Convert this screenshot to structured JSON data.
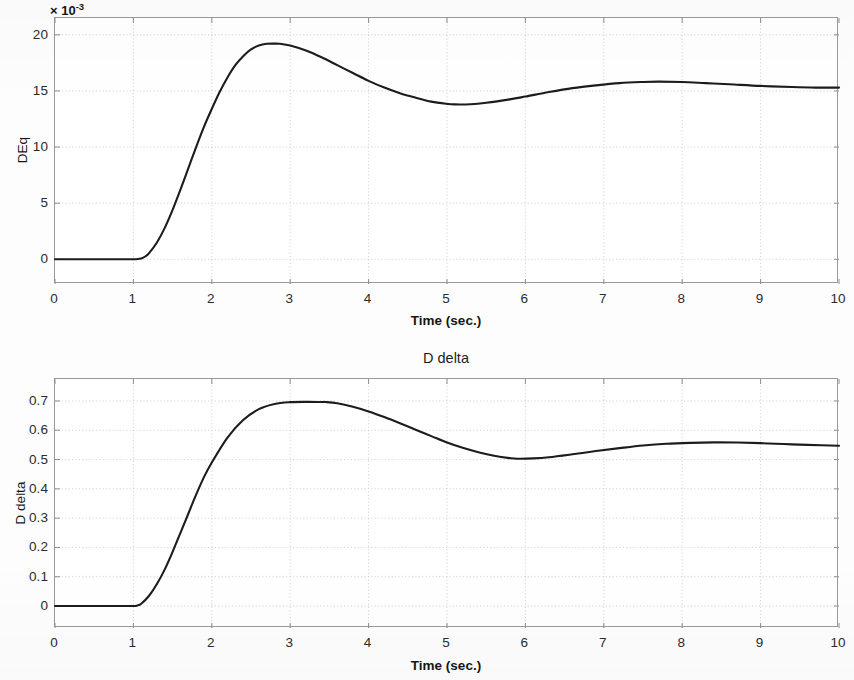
{
  "figure": {
    "background": "#ffffff",
    "curve_color": "#1c1c1c",
    "grid_color": "#c9c9c9",
    "axis_color": "#9a9a9a"
  },
  "panels": [
    {
      "id": "deq",
      "title": "",
      "exponent_label": "× 10",
      "exponent_power": "-3",
      "ylabel": "DEq",
      "xlabel": "Time (sec.)",
      "yticks": [
        "0",
        "5",
        "10",
        "15",
        "20"
      ],
      "xticks": [
        "0",
        "1",
        "2",
        "3",
        "4",
        "5",
        "6",
        "7",
        "8",
        "9",
        "10"
      ]
    },
    {
      "id": "ddelta",
      "title": "D delta",
      "exponent_label": "",
      "exponent_power": "",
      "ylabel": "D delta",
      "xlabel": "Time (sec.)",
      "yticks": [
        "0",
        "0.1",
        "0.2",
        "0.3",
        "0.4",
        "0.5",
        "0.6",
        "0.7"
      ],
      "xticks": [
        "0",
        "1",
        "2",
        "3",
        "4",
        "5",
        "6",
        "7",
        "8",
        "9",
        "10"
      ]
    }
  ],
  "chart_data": [
    {
      "type": "line",
      "title": "",
      "xlabel": "Time (sec.)",
      "ylabel": "DEq",
      "y_exponent": "×10^-3",
      "xlim": [
        0,
        10
      ],
      "ylim": [
        -2.2,
        21.5
      ],
      "xticks": [
        0,
        1,
        2,
        3,
        4,
        5,
        6,
        7,
        8,
        9,
        10
      ],
      "yticks": [
        0,
        5,
        10,
        15,
        20
      ],
      "grid": true,
      "legend": null,
      "series": [
        {
          "name": "DEq",
          "x": [
            0,
            0.2,
            0.4,
            0.6,
            0.8,
            1.0,
            1.05,
            1.1,
            1.15,
            1.2,
            1.3,
            1.4,
            1.5,
            1.6,
            1.7,
            1.8,
            1.9,
            2.0,
            2.1,
            2.2,
            2.3,
            2.4,
            2.5,
            2.6,
            2.7,
            2.8,
            2.87,
            3.0,
            3.2,
            3.4,
            3.6,
            3.8,
            4.0,
            4.2,
            4.4,
            4.6,
            4.8,
            5.0,
            5.1,
            5.3,
            5.5,
            5.8,
            6.0,
            6.3,
            6.6,
            6.9,
            7.2,
            7.5,
            7.7,
            8.0,
            8.3,
            8.6,
            9.0,
            9.4,
            9.7,
            10.0
          ],
          "y": [
            0,
            0,
            0,
            0,
            0,
            0,
            0.02,
            0.08,
            0.25,
            0.55,
            1.5,
            2.8,
            4.4,
            6.2,
            8.1,
            10.0,
            11.8,
            13.4,
            14.9,
            16.2,
            17.3,
            18.1,
            18.7,
            19.05,
            19.2,
            19.22,
            19.2,
            19.05,
            18.6,
            18.0,
            17.3,
            16.6,
            15.9,
            15.3,
            14.8,
            14.4,
            14.05,
            13.85,
            13.8,
            13.82,
            13.95,
            14.25,
            14.5,
            14.9,
            15.25,
            15.5,
            15.7,
            15.8,
            15.83,
            15.8,
            15.7,
            15.6,
            15.45,
            15.35,
            15.3,
            15.3
          ]
        }
      ]
    },
    {
      "type": "line",
      "title": "D delta",
      "xlabel": "Time (sec.)",
      "ylabel": "D delta",
      "xlim": [
        0,
        10
      ],
      "ylim": [
        -0.075,
        0.775
      ],
      "xticks": [
        0,
        1,
        2,
        3,
        4,
        5,
        6,
        7,
        8,
        9,
        10
      ],
      "yticks": [
        0,
        0.1,
        0.2,
        0.3,
        0.4,
        0.5,
        0.6,
        0.7
      ],
      "grid": true,
      "legend": null,
      "series": [
        {
          "name": "D delta",
          "x": [
            0,
            0.2,
            0.4,
            0.6,
            0.8,
            1.0,
            1.05,
            1.1,
            1.2,
            1.3,
            1.4,
            1.5,
            1.6,
            1.7,
            1.8,
            1.9,
            2.0,
            2.2,
            2.4,
            2.6,
            2.8,
            3.0,
            3.2,
            3.4,
            3.45,
            3.6,
            3.8,
            4.0,
            4.2,
            4.4,
            4.6,
            4.8,
            5.0,
            5.2,
            5.4,
            5.6,
            5.8,
            5.9,
            6.1,
            6.3,
            6.6,
            6.9,
            7.2,
            7.5,
            7.8,
            8.1,
            8.4,
            8.7,
            9.0,
            9.3,
            9.6,
            10.0
          ],
          "y": [
            0,
            0,
            0,
            0,
            0,
            0,
            0.002,
            0.008,
            0.035,
            0.075,
            0.125,
            0.185,
            0.25,
            0.315,
            0.38,
            0.44,
            0.49,
            0.575,
            0.635,
            0.672,
            0.69,
            0.696,
            0.697,
            0.6965,
            0.6965,
            0.692,
            0.68,
            0.664,
            0.645,
            0.624,
            0.602,
            0.58,
            0.558,
            0.54,
            0.525,
            0.513,
            0.505,
            0.503,
            0.504,
            0.508,
            0.518,
            0.529,
            0.539,
            0.548,
            0.554,
            0.557,
            0.5585,
            0.558,
            0.556,
            0.553,
            0.55,
            0.547
          ]
        }
      ]
    }
  ]
}
